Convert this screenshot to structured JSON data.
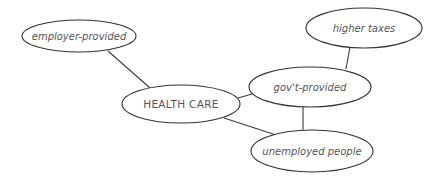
{
  "diagram": {
    "type": "concept-map",
    "center_node": "HEALTH CARE",
    "nodes": [
      {
        "id": "employer",
        "label": "employer-provided",
        "cx": 79,
        "cy": 36,
        "rx": 57,
        "ry": 16
      },
      {
        "id": "health",
        "label": "HEALTH CARE",
        "cx": 181,
        "cy": 104,
        "rx": 59,
        "ry": 19
      },
      {
        "id": "govt",
        "label": "gov't-provided",
        "cx": 310,
        "cy": 87,
        "rx": 61,
        "ry": 20
      },
      {
        "id": "taxes",
        "label": "higher taxes",
        "cx": 364,
        "cy": 28,
        "rx": 58,
        "ry": 20
      },
      {
        "id": "unemployed",
        "label": "unemployed people",
        "cx": 312,
        "cy": 151,
        "rx": 61,
        "ry": 21
      }
    ],
    "edges": [
      {
        "from": "employer",
        "to": "health"
      },
      {
        "from": "health",
        "to": "govt"
      },
      {
        "from": "health",
        "to": "unemployed"
      },
      {
        "from": "govt",
        "to": "taxes"
      },
      {
        "from": "govt",
        "to": "unemployed"
      }
    ]
  }
}
